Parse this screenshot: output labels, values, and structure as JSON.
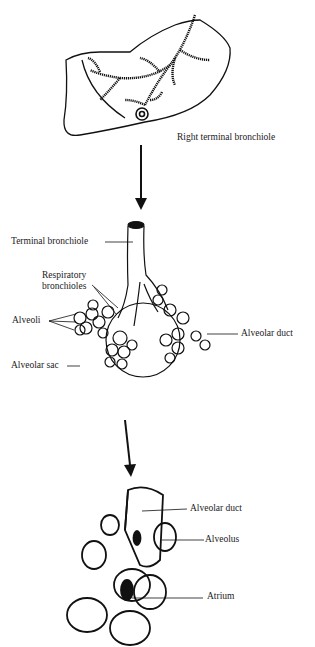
{
  "diagram": {
    "panels": [
      {
        "id": "lung",
        "labels": [
          {
            "key": "right_terminal_bronchiole",
            "text": "Right terminal bronchiole"
          }
        ]
      },
      {
        "id": "bronchiole-tree",
        "labels": [
          {
            "key": "terminal_bronchiole",
            "text": "Terminal bronchiole"
          },
          {
            "key": "respiratory_bronchioles_1",
            "text": "Respiratory"
          },
          {
            "key": "respiratory_bronchioles_2",
            "text": "bronchioles"
          },
          {
            "key": "alveoli",
            "text": "Alveoli"
          },
          {
            "key": "alveolar_duct",
            "text": "Alveolar duct"
          },
          {
            "key": "alveolar_sac",
            "text": "Alveolar sac"
          }
        ]
      },
      {
        "id": "alveolar-detail",
        "labels": [
          {
            "key": "alveolar_duct",
            "text": "Alveolar duct"
          },
          {
            "key": "alveolus",
            "text": "Alveolus"
          },
          {
            "key": "atrium",
            "text": "Atrium"
          }
        ]
      }
    ],
    "arrows": [
      "down-arrow-1",
      "down-arrow-2"
    ],
    "colors": {
      "ink": "#111111",
      "background": "#ffffff"
    }
  }
}
